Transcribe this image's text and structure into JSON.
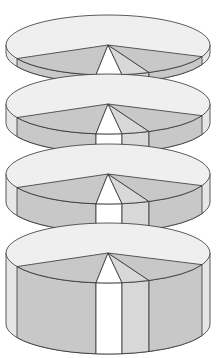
{
  "diagram": {
    "colors": {
      "top_light": "#efefef",
      "slice_gray": "#c8c8c8",
      "slice_mid": "#d8d8d8",
      "slice_white": "#ffffff",
      "side_light": "#e6e6e6",
      "outline": "#333333",
      "background": "#ffffff"
    },
    "geometry": {
      "cx": 108,
      "rx": 102,
      "ry": 30
    },
    "disks": [
      {
        "name": "disk-1",
        "cy": 45,
        "thickness": 8
      },
      {
        "name": "disk-2",
        "cy": 104,
        "thickness": 19
      },
      {
        "name": "disk-3",
        "cy": 174,
        "thickness": 28
      },
      {
        "name": "disk-4",
        "cy": 253,
        "thickness": 71
      }
    ],
    "slice_boundaries_x": [
      17,
      96,
      122,
      149,
      202
    ]
  }
}
